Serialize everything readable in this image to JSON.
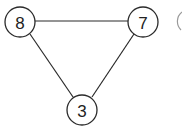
{
  "diagram": {
    "type": "graph",
    "nodes": [
      {
        "id": "n8",
        "label": "8",
        "cx": 20,
        "cy": 22,
        "r": 15
      },
      {
        "id": "n7",
        "label": "7",
        "cx": 143,
        "cy": 22,
        "r": 15
      },
      {
        "id": "n3",
        "label": "3",
        "cx": 82,
        "cy": 110,
        "r": 15
      }
    ],
    "edges": [
      {
        "from": "8",
        "to": "7"
      },
      {
        "from": "8",
        "to": "3"
      },
      {
        "from": "7",
        "to": "3"
      }
    ],
    "colors": {
      "stroke": "#2a2a2a",
      "background": "#ffffff"
    }
  }
}
